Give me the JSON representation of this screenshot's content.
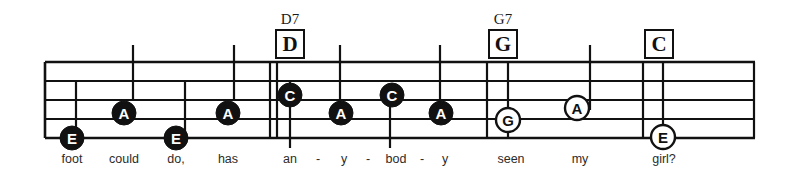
{
  "sheet": {
    "title_hidden": "",
    "staff": {
      "line_count": 5,
      "left_x": 45,
      "right_x": 755,
      "top_y": 62,
      "line_spacing": 19,
      "color": "#111111"
    },
    "chords": [
      {
        "id": "chord-d7",
        "superscript": "D7",
        "box_letter": "D",
        "x": 290,
        "sup_y": 24,
        "box_x": 276,
        "box_y": 30,
        "box_w": 28,
        "box_h": 28
      },
      {
        "id": "chord-g7",
        "superscript": "G7",
        "box_letter": "G",
        "x": 503,
        "sup_y": 24,
        "box_x": 489,
        "box_y": 30,
        "box_w": 28,
        "box_h": 28
      },
      {
        "id": "chord-c",
        "superscript": "",
        "box_letter": "C",
        "x": 659,
        "sup_y": 24,
        "box_x": 645,
        "box_y": 30,
        "box_w": 28,
        "box_h": 28
      }
    ],
    "barlines": [
      {
        "id": "barline-measure-2-a",
        "x": 270,
        "y1": 62,
        "y2": 138
      },
      {
        "id": "barline-measure-2-b",
        "x": 277,
        "y1": 62,
        "y2": 138
      },
      {
        "id": "barline-measure-3",
        "x": 487,
        "y1": 62,
        "y2": 138
      },
      {
        "id": "barline-measure-4",
        "x": 643,
        "y1": 62,
        "y2": 138
      },
      {
        "id": "barline-end",
        "x": 754,
        "y1": 62,
        "y2": 138
      }
    ],
    "beat_strokes": [
      {
        "id": "beat-stroke-1",
        "x": 76,
        "y1": 81,
        "y2": 138
      },
      {
        "id": "beat-stroke-2",
        "x": 133,
        "y1": 45,
        "y2": 100
      },
      {
        "id": "beat-stroke-3",
        "x": 185,
        "y1": 81,
        "y2": 138
      },
      {
        "id": "beat-stroke-4",
        "x": 234,
        "y1": 45,
        "y2": 100
      },
      {
        "id": "beat-stroke-5",
        "x": 290,
        "y1": 81,
        "y2": 148
      },
      {
        "id": "beat-stroke-6",
        "x": 340,
        "y1": 45,
        "y2": 110
      },
      {
        "id": "beat-stroke-7",
        "x": 390,
        "y1": 100,
        "y2": 148
      },
      {
        "id": "beat-stroke-8",
        "x": 440,
        "y1": 45,
        "y2": 110
      },
      {
        "id": "beat-stroke-9",
        "x": 508,
        "y1": 62,
        "y2": 138
      },
      {
        "id": "beat-stroke-10",
        "x": 590,
        "y1": 45,
        "y2": 110
      },
      {
        "id": "beat-stroke-11",
        "x": 663,
        "y1": 62,
        "y2": 138
      }
    ],
    "notes": [
      {
        "id": "note-1",
        "letter": "E",
        "cx": 72,
        "cy": 138,
        "r": 12,
        "style": "filled"
      },
      {
        "id": "note-2",
        "letter": "A",
        "cx": 124,
        "cy": 113,
        "r": 12,
        "style": "filled"
      },
      {
        "id": "note-3",
        "letter": "E",
        "cx": 176,
        "cy": 138,
        "r": 12,
        "style": "filled"
      },
      {
        "id": "note-4",
        "letter": "A",
        "cx": 228,
        "cy": 113,
        "r": 12,
        "style": "filled"
      },
      {
        "id": "note-5",
        "letter": "C",
        "cx": 290,
        "cy": 95,
        "r": 12,
        "style": "filled"
      },
      {
        "id": "note-6",
        "letter": "A",
        "cx": 341,
        "cy": 113,
        "r": 12,
        "style": "filled"
      },
      {
        "id": "note-7",
        "letter": "C",
        "cx": 392,
        "cy": 95,
        "r": 12,
        "style": "filled"
      },
      {
        "id": "note-8",
        "letter": "A",
        "cx": 441,
        "cy": 113,
        "r": 12,
        "style": "filled"
      },
      {
        "id": "note-9",
        "letter": "G",
        "cx": 508,
        "cy": 120,
        "r": 12,
        "style": "hollow"
      },
      {
        "id": "note-10",
        "letter": "A",
        "cx": 577,
        "cy": 108,
        "r": 12,
        "style": "hollow"
      },
      {
        "id": "note-11",
        "letter": "E",
        "cx": 663,
        "cy": 137,
        "r": 12,
        "style": "hollow"
      }
    ],
    "lyrics": [
      {
        "id": "lyric-foot",
        "text": "foot",
        "x": 72,
        "y": 163
      },
      {
        "id": "lyric-could",
        "text": "could",
        "x": 124,
        "y": 163
      },
      {
        "id": "lyric-do",
        "text": "do,",
        "x": 176,
        "y": 163
      },
      {
        "id": "lyric-has",
        "text": "has",
        "x": 228,
        "y": 163
      },
      {
        "id": "lyric-an",
        "text": "an",
        "x": 290,
        "y": 163
      },
      {
        "id": "lyric-hyphen-1",
        "text": "-",
        "x": 318,
        "y": 163
      },
      {
        "id": "lyric-y-1",
        "text": "y",
        "x": 344,
        "y": 163
      },
      {
        "id": "lyric-hyphen-2",
        "text": "-",
        "x": 368,
        "y": 163
      },
      {
        "id": "lyric-bod",
        "text": "bod",
        "x": 396,
        "y": 163
      },
      {
        "id": "lyric-hyphen-3",
        "text": "-",
        "x": 422,
        "y": 163
      },
      {
        "id": "lyric-y-2",
        "text": "y",
        "x": 445,
        "y": 163
      },
      {
        "id": "lyric-seen",
        "text": "seen",
        "x": 511,
        "y": 163
      },
      {
        "id": "lyric-my",
        "text": "my",
        "x": 580,
        "y": 163
      },
      {
        "id": "lyric-girl",
        "text": "girl?",
        "x": 664,
        "y": 163
      }
    ]
  }
}
